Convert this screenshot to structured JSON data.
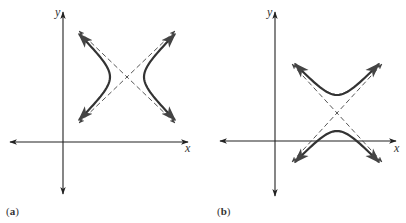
{
  "figure": {
    "colors": {
      "axis": "#222222",
      "curve": "#333333",
      "asymptote": "#444444",
      "background": "#ffffff"
    },
    "panels": [
      {
        "id": "a",
        "label_open": "(",
        "label_letter": "a",
        "label_close": ")",
        "x_axis_label": "x",
        "y_axis_label": "y",
        "description": "Hyperbola with horizontal transverse axis, center shifted to first quadrant, with dashed asymptotes",
        "orientation": "horizontal",
        "geometry": {
          "origin": [
            63,
            142
          ],
          "x_axis": [
            10,
            188
          ],
          "y_axis": [
            12,
            194
          ],
          "center": [
            127,
            77
          ],
          "asymptote_half_w": 48,
          "asymptote_half_h": 46,
          "vertex_offset": 17
        }
      },
      {
        "id": "b",
        "label_open": "(",
        "label_letter": "b",
        "label_close": ")",
        "x_axis_label": "x",
        "y_axis_label": "y",
        "description": "Hyperbola with vertical transverse axis, center shifted to first quadrant, with dashed asymptotes",
        "orientation": "vertical",
        "geometry": {
          "origin": [
            275,
            141
          ],
          "x_axis": [
            220,
            396
          ],
          "y_axis": [
            12,
            196
          ],
          "center": [
            337,
            113
          ],
          "asymptote_half_w": 45,
          "asymptote_half_h": 49,
          "vertex_offset": 18
        }
      }
    ]
  }
}
